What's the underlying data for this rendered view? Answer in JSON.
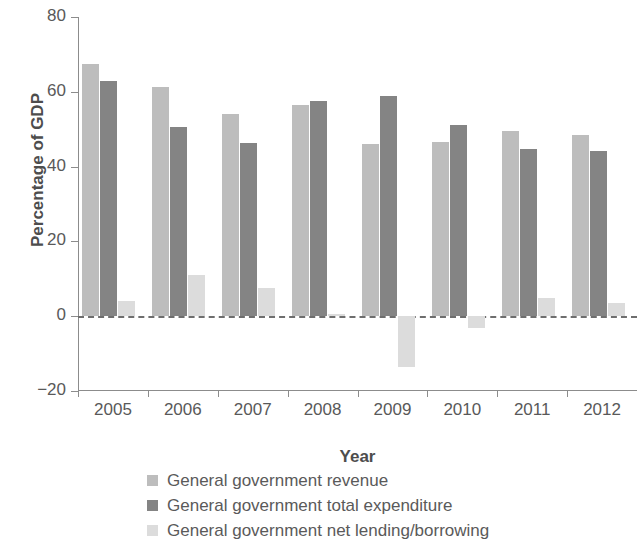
{
  "chart_data": {
    "type": "bar",
    "title": "",
    "xlabel": "Year",
    "ylabel": "Percentage of GDP",
    "categories": [
      "2005",
      "2006",
      "2007",
      "2008",
      "2009",
      "2010",
      "2011",
      "2012"
    ],
    "ylim": [
      -20,
      80
    ],
    "yticks": [
      80,
      60,
      40,
      20,
      0,
      -20
    ],
    "ytick_labels": [
      "80",
      "60",
      "40",
      "20",
      "0",
      "−20"
    ],
    "grid": false,
    "zero_line": true,
    "legend_position": "bottom",
    "series": [
      {
        "name": "General government revenue",
        "color": "#bdbdbd",
        "values": [
          67.3,
          61.2,
          54.0,
          56.5,
          46.0,
          46.5,
          49.5,
          48.5
        ]
      },
      {
        "name": "General government total expenditure",
        "color": "#848484",
        "values": [
          63.0,
          50.5,
          46.2,
          57.5,
          59.0,
          51.0,
          44.7,
          44.3
        ]
      },
      {
        "name": "General government net lending/borrowing",
        "color": "#dcdcdc",
        "values": [
          4.0,
          11.0,
          7.6,
          0.5,
          -13.5,
          -3.2,
          5.0,
          3.5
        ]
      }
    ]
  },
  "axes": {
    "y_title": "Percentage of GDP",
    "x_title": "Year"
  },
  "legend": {
    "items": [
      {
        "label": "General government revenue",
        "color": "#bdbdbd"
      },
      {
        "label": "General government total expenditure",
        "color": "#848484"
      },
      {
        "label": "General government net lending/borrowing",
        "color": "#dcdcdc"
      }
    ]
  }
}
